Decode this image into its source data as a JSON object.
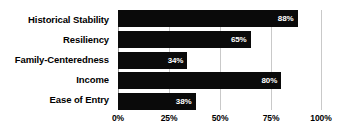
{
  "chart_data": {
    "type": "bar",
    "orientation": "horizontal",
    "title": "",
    "xlabel": "",
    "ylabel": "",
    "categories": [
      "Historical Stability",
      "Resiliency",
      "Family-Centeredness",
      "Income",
      "Ease of Entry"
    ],
    "values": [
      88,
      65,
      34,
      80,
      38
    ],
    "value_labels": [
      "88%",
      "65%",
      "34%",
      "80%",
      "38%"
    ],
    "xlim": [
      0,
      100
    ],
    "xticks": [
      0,
      25,
      50,
      75,
      100
    ],
    "xtick_labels": [
      "0%",
      "25%",
      "50%",
      "75%",
      "100%"
    ],
    "grid": true,
    "grid_axis": "x",
    "legend": false,
    "bar_color": "#0a0a0a",
    "value_label_color": "#ffffff",
    "gridline_color": "#c9c9c9",
    "axis_line_color": "#9a9a9a",
    "background_color": "#ffffff"
  }
}
